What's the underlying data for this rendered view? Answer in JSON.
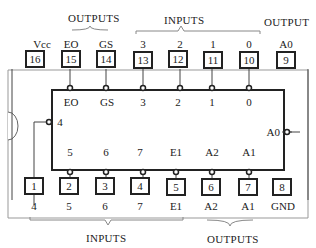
{
  "diagram": {
    "type": "ic-pinout",
    "chip": "8-line to 3-line priority encoder",
    "top_groups": {
      "outputs_left": "OUTPUTS",
      "inputs": "INPUTS",
      "output_right": "OUTPUT"
    },
    "bottom_groups": {
      "inputs": "INPUTS",
      "outputs": "OUTPUTS"
    },
    "top_pins": [
      {
        "num": "16",
        "label": "Vcc"
      },
      {
        "num": "15",
        "label": "EO"
      },
      {
        "num": "14",
        "label": "GS"
      },
      {
        "num": "13",
        "label": "3"
      },
      {
        "num": "12",
        "label": "2"
      },
      {
        "num": "11",
        "label": "1"
      },
      {
        "num": "10",
        "label": "0"
      },
      {
        "num": "9",
        "label": "A0"
      }
    ],
    "bottom_pins": [
      {
        "num": "1",
        "label": "4"
      },
      {
        "num": "2",
        "label": "5"
      },
      {
        "num": "3",
        "label": "6"
      },
      {
        "num": "4",
        "label": "7"
      },
      {
        "num": "5",
        "label": "E1"
      },
      {
        "num": "6",
        "label": "A2"
      },
      {
        "num": "7",
        "label": "A1"
      },
      {
        "num": "8",
        "label": "GND"
      }
    ],
    "inner_top": [
      "EO",
      "GS",
      "3",
      "2",
      "1",
      "0"
    ],
    "inner_bottom": [
      "5",
      "6",
      "7",
      "E1",
      "A2",
      "A1"
    ],
    "inner_left": "4",
    "inner_right": "A0"
  }
}
